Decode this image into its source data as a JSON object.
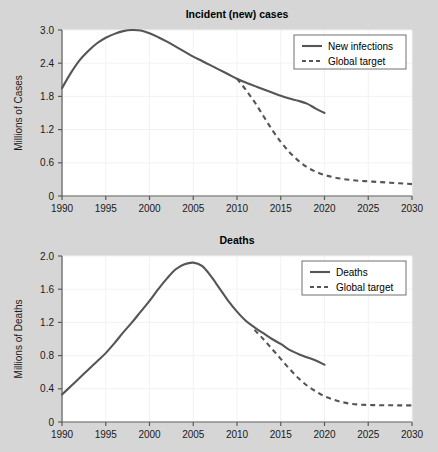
{
  "figure": {
    "background_color": "#d6d6d6",
    "line_color": "#555555",
    "plot_background": "#ffffff"
  },
  "chart_data": [
    {
      "id": "incident",
      "type": "line",
      "title": "Incident (new) cases",
      "xlabel": "",
      "ylabel": "Millions of Cases",
      "xlim": [
        1990,
        2030
      ],
      "ylim": [
        0,
        3.0
      ],
      "xticks": [
        1990,
        1995,
        2000,
        2005,
        2010,
        2015,
        2020,
        2025,
        2030
      ],
      "xticklabels": [
        "1990",
        "1995",
        "2000",
        "2005",
        "2010",
        "2015",
        "2020",
        "2025",
        "2030"
      ],
      "yticks": [
        0,
        0.6,
        1.2,
        1.8,
        2.4,
        3.0
      ],
      "yticklabels": [
        "0",
        "0.6",
        "1.2",
        "1.8",
        "2.4",
        "3.0"
      ],
      "grid": true,
      "legend_position": "upper right",
      "series": [
        {
          "name": "New infections",
          "style": "solid",
          "x": [
            1990,
            1991,
            1992,
            1993,
            1994,
            1995,
            1996,
            1997,
            1998,
            1999,
            2000,
            2001,
            2002,
            2003,
            2004,
            2005,
            2006,
            2007,
            2008,
            2009,
            2010,
            2011,
            2012,
            2013,
            2014,
            2015,
            2016,
            2017,
            2018,
            2019,
            2020
          ],
          "values": [
            1.95,
            2.22,
            2.45,
            2.62,
            2.76,
            2.86,
            2.93,
            2.98,
            3.0,
            2.99,
            2.94,
            2.87,
            2.79,
            2.7,
            2.61,
            2.52,
            2.44,
            2.36,
            2.28,
            2.2,
            2.12,
            2.05,
            1.99,
            1.93,
            1.87,
            1.81,
            1.76,
            1.72,
            1.67,
            1.58,
            1.5
          ]
        },
        {
          "name": "Global target",
          "style": "dashed",
          "x": [
            2010,
            2011,
            2012,
            2013,
            2014,
            2015,
            2016,
            2017,
            2018,
            2019,
            2020,
            2021,
            2022,
            2023,
            2024,
            2025,
            2026,
            2027,
            2028,
            2029,
            2030
          ],
          "values": [
            2.12,
            1.92,
            1.7,
            1.45,
            1.2,
            0.98,
            0.79,
            0.64,
            0.52,
            0.44,
            0.38,
            0.34,
            0.31,
            0.29,
            0.275,
            0.265,
            0.255,
            0.245,
            0.235,
            0.225,
            0.215
          ]
        }
      ]
    },
    {
      "id": "deaths",
      "type": "line",
      "title": "Deaths",
      "xlabel": "",
      "ylabel": "Millions of Deaths",
      "xlim": [
        1990,
        2030
      ],
      "ylim": [
        0,
        2.0
      ],
      "xticks": [
        1990,
        1995,
        2000,
        2005,
        2010,
        2015,
        2020,
        2025,
        2030
      ],
      "xticklabels": [
        "1990",
        "1995",
        "2000",
        "2005",
        "2010",
        "2015",
        "2020",
        "2025",
        "2030"
      ],
      "yticks": [
        0,
        0.4,
        0.8,
        1.2,
        1.6,
        2.0
      ],
      "yticklabels": [
        "0",
        "0.4",
        "0.8",
        "1.2",
        "1.6",
        "2.0"
      ],
      "grid": true,
      "legend_position": "upper right",
      "series": [
        {
          "name": "Deaths",
          "style": "solid",
          "x": [
            1990,
            1991,
            1992,
            1993,
            1994,
            1995,
            1996,
            1997,
            1998,
            1999,
            2000,
            2001,
            2002,
            2003,
            2004,
            2005,
            2006,
            2007,
            2008,
            2009,
            2010,
            2011,
            2012,
            2013,
            2014,
            2015,
            2016,
            2017,
            2018,
            2019,
            2020
          ],
          "values": [
            0.33,
            0.43,
            0.53,
            0.63,
            0.73,
            0.83,
            0.95,
            1.08,
            1.2,
            1.33,
            1.46,
            1.6,
            1.73,
            1.84,
            1.9,
            1.92,
            1.88,
            1.76,
            1.61,
            1.46,
            1.33,
            1.22,
            1.14,
            1.07,
            1.0,
            0.94,
            0.87,
            0.82,
            0.78,
            0.74,
            0.69
          ]
        },
        {
          "name": "Global target",
          "style": "dashed",
          "x": [
            2012,
            2013,
            2014,
            2015,
            2016,
            2017,
            2018,
            2019,
            2020,
            2021,
            2022,
            2023,
            2024,
            2025,
            2026,
            2027,
            2028,
            2029,
            2030
          ],
          "values": [
            1.11,
            1.0,
            0.88,
            0.76,
            0.64,
            0.53,
            0.44,
            0.37,
            0.31,
            0.27,
            0.24,
            0.22,
            0.21,
            0.205,
            0.203,
            0.202,
            0.201,
            0.2,
            0.2
          ]
        }
      ]
    }
  ]
}
